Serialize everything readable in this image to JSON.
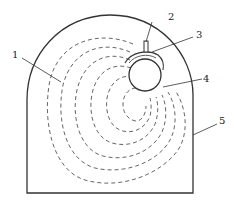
{
  "diagram": {
    "labels": [
      {
        "id": "1",
        "text": "1"
      },
      {
        "id": "2",
        "text": "2"
      },
      {
        "id": "3",
        "text": "3"
      },
      {
        "id": "4",
        "text": "4"
      },
      {
        "id": "5",
        "text": "5"
      }
    ],
    "colors": {
      "stroke": "#333333",
      "dashed": "#555555",
      "background": "#ffffff"
    }
  }
}
